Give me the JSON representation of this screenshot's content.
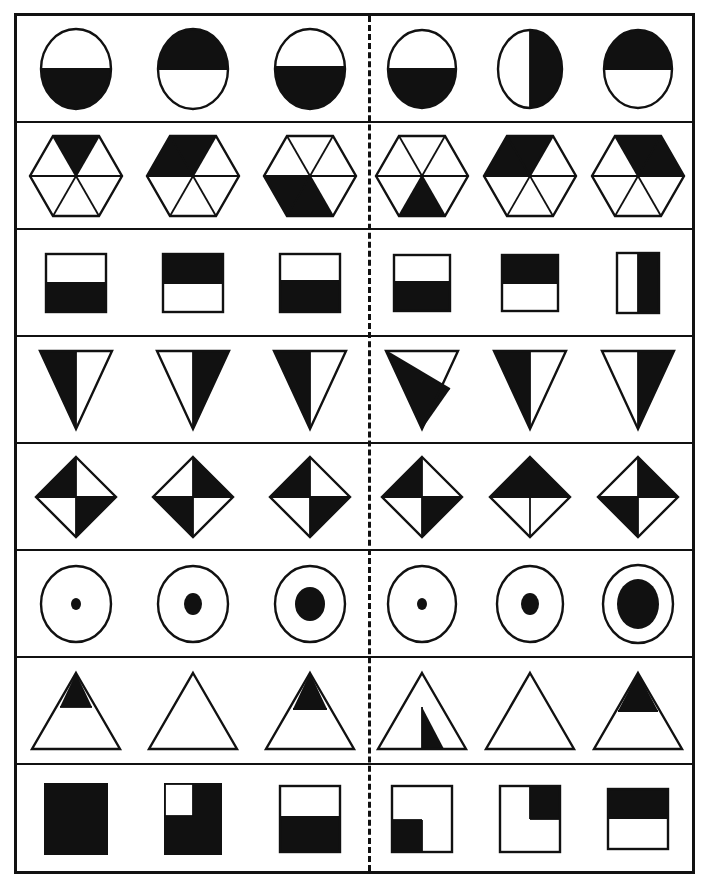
{
  "worksheet": {
    "title": "Shape fraction matching worksheet",
    "colors": {
      "ink": "#111111",
      "paper": "#ffffff"
    },
    "layout": {
      "columns": 2,
      "items_per_half": 3,
      "rows": 8,
      "divider": "vertical-dashed-line"
    },
    "rows": [
      {
        "index": 1,
        "shape": "circle",
        "left": [
          {
            "label": "circle-bottom-half-filled",
            "fill": "bottom-half"
          },
          {
            "label": "circle-top-half-filled",
            "fill": "top-half"
          },
          {
            "label": "circle-bottom-half-filled",
            "fill": "bottom-half"
          }
        ],
        "right": [
          {
            "label": "circle-bottom-half-filled",
            "fill": "bottom-half"
          },
          {
            "label": "circle-right-half-filled",
            "fill": "right-half"
          },
          {
            "label": "circle-top-half-filled",
            "fill": "top-half"
          }
        ]
      },
      {
        "index": 2,
        "shape": "hexagon-six-sectors",
        "left": [
          {
            "label": "hexagon-top-sector-filled",
            "fill": "sector-top"
          },
          {
            "label": "hexagon-top-left-sector-filled",
            "fill": "sector-top-left"
          },
          {
            "label": "hexagon-bottom-left-sector-filled",
            "fill": "sector-bottom-left"
          }
        ],
        "right": [
          {
            "label": "hexagon-bottom-sector-filled",
            "fill": "sector-bottom"
          },
          {
            "label": "hexagon-top-left-sector-filled",
            "fill": "sector-top-left"
          },
          {
            "label": "hexagon-top-right-sector-filled",
            "fill": "sector-top-right"
          }
        ]
      },
      {
        "index": 3,
        "shape": "square",
        "left": [
          {
            "label": "square-bottom-half-filled",
            "fill": "bottom-half"
          },
          {
            "label": "square-top-half-filled",
            "fill": "top-half"
          },
          {
            "label": "square-bottom-half-filled",
            "fill": "bottom-half"
          }
        ],
        "right": [
          {
            "label": "square-bottom-half-filled",
            "fill": "bottom-half"
          },
          {
            "label": "square-top-half-filled",
            "fill": "top-half"
          },
          {
            "label": "rectangle-right-half-filled",
            "fill": "right-half-tall"
          }
        ]
      },
      {
        "index": 4,
        "shape": "triangle-down",
        "left": [
          {
            "label": "triangle-down-left-half-filled",
            "fill": "left-half"
          },
          {
            "label": "triangle-down-right-half-filled",
            "fill": "right-half"
          },
          {
            "label": "triangle-down-left-half-filled",
            "fill": "left-half"
          }
        ],
        "right": [
          {
            "label": "triangle-down-diagonal-lower-left-filled",
            "fill": "diagonal-lower-left"
          },
          {
            "label": "triangle-down-left-half-filled",
            "fill": "left-half"
          },
          {
            "label": "triangle-down-right-half-filled",
            "fill": "right-half"
          }
        ]
      },
      {
        "index": 5,
        "shape": "diamond-quadrants",
        "left": [
          {
            "label": "diamond-top-left-bottom-right-filled",
            "fill": "tl-br"
          },
          {
            "label": "diamond-top-right-bottom-left-filled",
            "fill": "tr-bl"
          },
          {
            "label": "diamond-top-left-bottom-right-filled",
            "fill": "tl-br"
          }
        ],
        "right": [
          {
            "label": "diamond-top-left-bottom-right-filled",
            "fill": "tl-br"
          },
          {
            "label": "diamond-top-half-filled",
            "fill": "top-half"
          },
          {
            "label": "diamond-top-right-bottom-left-filled",
            "fill": "tr-bl"
          }
        ]
      },
      {
        "index": 6,
        "shape": "circle-with-center-dot",
        "left": [
          {
            "label": "circle-small-dot",
            "fill": "dot-small"
          },
          {
            "label": "circle-medium-dot",
            "fill": "dot-medium"
          },
          {
            "label": "circle-large-dot",
            "fill": "dot-large"
          }
        ],
        "right": [
          {
            "label": "circle-small-dot",
            "fill": "dot-small"
          },
          {
            "label": "circle-medium-dot",
            "fill": "dot-medium"
          },
          {
            "label": "circle-extra-large-dot",
            "fill": "dot-xlarge"
          }
        ]
      },
      {
        "index": 7,
        "shape": "triangle-up",
        "left": [
          {
            "label": "triangle-up-top-tip-filled",
            "fill": "top-tip"
          },
          {
            "label": "triangle-up-empty",
            "fill": "none"
          },
          {
            "label": "triangle-up-top-tip-filled",
            "fill": "top-tip"
          }
        ],
        "right": [
          {
            "label": "triangle-up-bottom-right-inner-filled",
            "fill": "inner-bottom-right"
          },
          {
            "label": "triangle-up-empty",
            "fill": "none"
          },
          {
            "label": "triangle-up-top-tip-filled",
            "fill": "top-tip"
          }
        ]
      },
      {
        "index": 8,
        "shape": "square-quadrant-fill",
        "left": [
          {
            "label": "square-fully-filled",
            "fill": "all"
          },
          {
            "label": "square-all-but-top-left-filled",
            "fill": "all-minus-top-left"
          },
          {
            "label": "square-bottom-half-filled",
            "fill": "bottom-half"
          }
        ],
        "right": [
          {
            "label": "square-bottom-left-quadrant-filled",
            "fill": "quadrant-bottom-left"
          },
          {
            "label": "square-top-right-quadrant-filled",
            "fill": "quadrant-top-right"
          },
          {
            "label": "square-top-half-filled",
            "fill": "top-half"
          }
        ]
      }
    ]
  }
}
